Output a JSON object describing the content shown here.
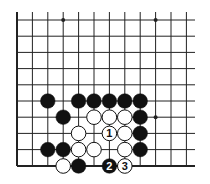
{
  "diagram": {
    "type": "go-board-fragment",
    "grid": {
      "x": [
        17,
        32.4,
        47.8,
        63.2,
        78.6,
        94,
        109.4,
        124.8,
        140.2,
        155.6,
        171,
        186.4
      ],
      "y": [
        20,
        36.2,
        52.4,
        68.6,
        84.8,
        101,
        117.2,
        133.4,
        149.6,
        166
      ],
      "left_edge": true,
      "bottom_edge": true,
      "top_extends_to": 12,
      "right_extends_to": 195
    },
    "star_points": [
      [
        3,
        0
      ],
      [
        9,
        0
      ],
      [
        9,
        6
      ]
    ],
    "stones": [
      {
        "col": 2,
        "row": 5,
        "color": "black",
        "label": ""
      },
      {
        "col": 4,
        "row": 5,
        "color": "black",
        "label": ""
      },
      {
        "col": 5,
        "row": 5,
        "color": "black",
        "label": ""
      },
      {
        "col": 6,
        "row": 5,
        "color": "black",
        "label": ""
      },
      {
        "col": 7,
        "row": 5,
        "color": "black",
        "label": ""
      },
      {
        "col": 8,
        "row": 5,
        "color": "black",
        "label": ""
      },
      {
        "col": 3,
        "row": 6,
        "color": "black",
        "label": ""
      },
      {
        "col": 5,
        "row": 6,
        "color": "white",
        "label": ""
      },
      {
        "col": 6,
        "row": 6,
        "color": "white",
        "label": ""
      },
      {
        "col": 7,
        "row": 6,
        "color": "white",
        "label": ""
      },
      {
        "col": 8,
        "row": 6,
        "color": "black",
        "label": ""
      },
      {
        "col": 4,
        "row": 7,
        "color": "white",
        "label": ""
      },
      {
        "col": 6,
        "row": 7,
        "color": "white",
        "label": "1"
      },
      {
        "col": 7,
        "row": 7,
        "color": "white",
        "label": ""
      },
      {
        "col": 8,
        "row": 7,
        "color": "black",
        "label": ""
      },
      {
        "col": 2,
        "row": 8,
        "color": "black",
        "label": ""
      },
      {
        "col": 3,
        "row": 8,
        "color": "black",
        "label": ""
      },
      {
        "col": 4,
        "row": 8,
        "color": "white",
        "label": ""
      },
      {
        "col": 5,
        "row": 8,
        "color": "white",
        "label": ""
      },
      {
        "col": 7,
        "row": 8,
        "color": "white",
        "label": ""
      },
      {
        "col": 8,
        "row": 8,
        "color": "black",
        "label": ""
      },
      {
        "col": 3,
        "row": 9,
        "color": "white",
        "label": ""
      },
      {
        "col": 4,
        "row": 9,
        "color": "black",
        "label": ""
      },
      {
        "col": 6,
        "row": 9,
        "color": "black",
        "label": "2"
      },
      {
        "col": 7,
        "row": 9,
        "color": "white",
        "label": "3"
      }
    ],
    "colors": {
      "line": "#222222",
      "black": "#111111",
      "white": "#ffffff"
    }
  }
}
